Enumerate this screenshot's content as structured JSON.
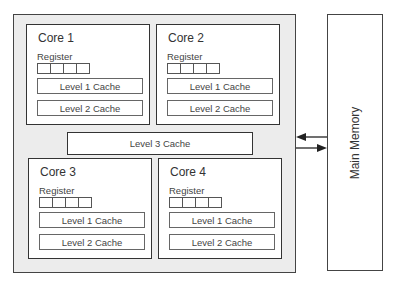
{
  "diagram": {
    "cores": [
      {
        "title": "Core 1",
        "register_label": "Register",
        "register_cells": 4,
        "l1": "Level 1 Cache",
        "l2": "Level 2 Cache"
      },
      {
        "title": "Core 2",
        "register_label": "Register",
        "register_cells": 4,
        "l1": "Level 1 Cache",
        "l2": "Level 2 Cache"
      },
      {
        "title": "Core 3",
        "register_label": "Register",
        "register_cells": 4,
        "l1": "Level 1 Cache",
        "l2": "Level 2 Cache"
      },
      {
        "title": "Core 4",
        "register_label": "Register",
        "register_cells": 4,
        "l1": "Level 1 Cache",
        "l2": "Level 2 Cache"
      }
    ],
    "shared_cache": "Level 3 Cache",
    "memory": "Main Memory",
    "colors": {
      "chip_bg": "#ececec",
      "border": "#333333",
      "box_bg": "#ffffff"
    }
  }
}
